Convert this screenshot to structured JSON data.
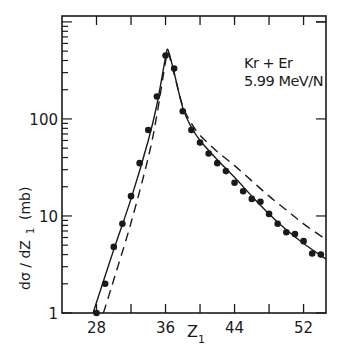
{
  "chart_data": {
    "type": "scatter",
    "title": "",
    "annotation": [
      "Kr + Er",
      "5.99 MeV/N"
    ],
    "xlabel": "Z",
    "xlabel_sub": "1",
    "ylabel": "dσ / dZ",
    "ylabel_sub": "1",
    "ylabel_unit": "(mb)",
    "yscale": "log",
    "xlim": [
      24,
      54.6
    ],
    "ylim": [
      1,
      1150
    ],
    "xticks": [
      28,
      32,
      36,
      40,
      44,
      48,
      52
    ],
    "xtick_labels": [
      "28",
      "",
      "36",
      "",
      "44",
      "",
      "52"
    ],
    "yticks": [
      1,
      10,
      100
    ],
    "ytick_labels": [
      "1",
      "10",
      "100"
    ],
    "grid": false,
    "legend": null,
    "series": [
      {
        "name": "Experimental data",
        "style": "markers",
        "x": [
          28,
          29,
          30,
          31,
          32,
          33,
          34,
          35,
          36,
          37,
          38,
          39,
          40,
          41,
          42,
          43,
          44,
          45,
          46,
          47,
          48,
          49,
          50,
          51,
          52,
          53,
          54
        ],
        "y": [
          1.0,
          2.0,
          4.8,
          8.3,
          16,
          35,
          77,
          170,
          450,
          330,
          120,
          77,
          57,
          44,
          35,
          29,
          22,
          18,
          15,
          14,
          10.5,
          8.3,
          6.8,
          6.5,
          5.5,
          4.1,
          4.0
        ]
      },
      {
        "name": "Calculation (solid)",
        "style": "solid",
        "x": [
          27.6,
          30,
          32,
          34,
          35,
          36,
          36.3,
          37,
          38,
          39,
          40,
          42,
          44,
          46,
          48,
          50,
          52,
          54.6
        ],
        "y": [
          1.0,
          4.5,
          15,
          60,
          140,
          430,
          510,
          300,
          130,
          82,
          60,
          38,
          25,
          16,
          10.5,
          7.2,
          5.2,
          3.6
        ]
      },
      {
        "name": "Calculation (dashed)",
        "style": "dashed",
        "x": [
          28.8,
          30,
          32,
          34,
          35,
          36,
          36.3,
          37,
          38,
          39,
          40,
          42,
          44,
          46,
          48,
          50,
          52,
          54.6
        ],
        "y": [
          1.0,
          2.2,
          8.5,
          40,
          110,
          390,
          480,
          290,
          135,
          90,
          68,
          46,
          33,
          23,
          16,
          11.5,
          8.3,
          5.7
        ]
      }
    ]
  }
}
